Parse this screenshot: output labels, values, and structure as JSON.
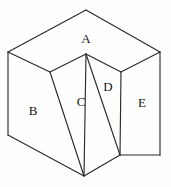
{
  "figure": {
    "kind": "line-drawing",
    "canvas": {
      "width": 171,
      "height": 187
    },
    "colors": {
      "background": "#fdfdfc",
      "stroke": "#2b2b2b",
      "face_fill": "#fefefe",
      "label_text": "#181818"
    },
    "vertices": {
      "top_apex": [
        86,
        10
      ],
      "left_corner": [
        8,
        52
      ],
      "right_corner": [
        160,
        52
      ],
      "inner_apex": [
        86,
        54
      ],
      "left_ridge_top": [
        50,
        72
      ],
      "right_ridge_top": [
        121,
        72
      ],
      "bottom_left": [
        8,
        135
      ],
      "bottom_apex": [
        84,
        176
      ],
      "inner_bottom": [
        120,
        155
      ],
      "bottom_right": [
        160,
        155
      ]
    },
    "edges": [
      {
        "name": "top-left-edge",
        "from": "left_corner",
        "to": "top_apex"
      },
      {
        "name": "top-right-edge",
        "from": "top_apex",
        "to": "right_corner"
      },
      {
        "name": "top-inner-left-edge",
        "from": "left_ridge_top",
        "to": "inner_apex"
      },
      {
        "name": "top-inner-right-edge",
        "from": "inner_apex",
        "to": "right_ridge_top"
      },
      {
        "name": "left-back-edge",
        "from": "left_corner",
        "to": "left_ridge_top"
      },
      {
        "name": "right-back-edge",
        "from": "right_corner",
        "to": "right_ridge_top"
      },
      {
        "name": "left-vertical-edge",
        "from": "left_corner",
        "to": "bottom_left"
      },
      {
        "name": "right-vertical-edge",
        "from": "right_corner",
        "to": "bottom_right"
      },
      {
        "name": "bottom-left-edge",
        "from": "bottom_left",
        "to": "bottom_apex"
      },
      {
        "name": "bottom-right-edge",
        "from": "inner_bottom",
        "to": "bottom_right"
      },
      {
        "name": "groove-left-edge",
        "from": "left_ridge_top",
        "to": "bottom_apex"
      },
      {
        "name": "groove-right-edge",
        "from": "inner_apex",
        "to": "bottom_apex"
      },
      {
        "name": "groove-inner-edge",
        "from": "inner_apex",
        "to": "inner_bottom"
      },
      {
        "name": "inner-vertical-edge",
        "from": "right_ridge_top",
        "to": "inner_bottom"
      },
      {
        "name": "bottom-notch-edge",
        "from": "bottom_apex",
        "to": "inner_bottom"
      }
    ],
    "faces": [
      {
        "id": "A",
        "label": "A",
        "name": "face-a-top",
        "label_x": 86,
        "label_y": 40,
        "polygon": "8,52 86,10 160,52 121,72 86,54 50,72"
      },
      {
        "id": "B",
        "label": "B",
        "name": "face-b-left",
        "label_x": 33,
        "label_y": 112,
        "polygon": "8,52 50,72 84,176 8,135"
      },
      {
        "id": "C",
        "label": "C",
        "name": "face-c-groove-left",
        "label_x": 81,
        "label_y": 103,
        "polygon": "50,72 86,54 84,176"
      },
      {
        "id": "D",
        "label": "D",
        "name": "face-d-groove-right",
        "label_x": 108,
        "label_y": 88,
        "polygon": "86,54 120,155 84,176"
      },
      {
        "id": "E",
        "label": "E",
        "name": "face-e-right",
        "label_x": 142,
        "label_y": 104,
        "polygon": "121,72 160,52 160,155 120,155"
      }
    ]
  }
}
